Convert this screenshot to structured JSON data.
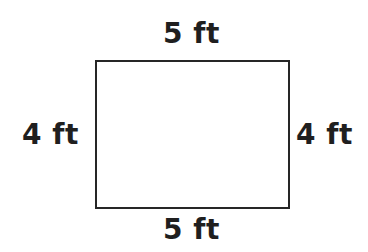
{
  "figure": {
    "type": "geometry-diagram",
    "shape": "rectangle",
    "background_color": "#ffffff",
    "stroke_color": "#262626",
    "text_color": "#1f1f1f",
    "labels": {
      "top": "5 ft",
      "bottom": "5 ft",
      "left": "4 ft",
      "right": "4 ft"
    }
  },
  "chart_data": {
    "type": "diagram",
    "shape": "rectangle",
    "unit": "ft",
    "width": 5,
    "height": 4,
    "edge_labels": [
      {
        "side": "top",
        "text": "5 ft",
        "value": 5,
        "unit": "ft"
      },
      {
        "side": "right",
        "text": "4 ft",
        "value": 4,
        "unit": "ft"
      },
      {
        "side": "bottom",
        "text": "5 ft",
        "value": 5,
        "unit": "ft"
      },
      {
        "side": "left",
        "text": "4 ft",
        "value": 4,
        "unit": "ft"
      }
    ],
    "title": "",
    "xlabel": "",
    "ylabel": ""
  }
}
